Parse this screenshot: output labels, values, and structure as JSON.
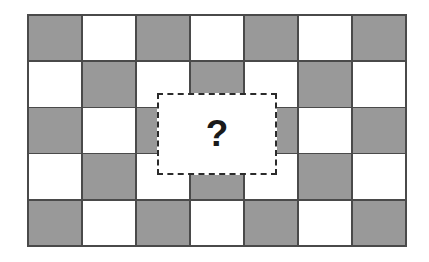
{
  "figure": {
    "background_color": "#ffffff"
  },
  "grid": {
    "name": "checkerboard",
    "columns": 7,
    "rows": 5,
    "cell_dark_color": "#999999",
    "cell_light_color": "#ffffff",
    "gridline_color": "#4a4a4a",
    "pattern": [
      [
        "dark",
        "light",
        "dark",
        "light",
        "dark",
        "light",
        "dark"
      ],
      [
        "light",
        "dark",
        "light",
        "dark",
        "light",
        "dark",
        "light"
      ],
      [
        "dark",
        "light",
        "dark",
        "light",
        "dark",
        "light",
        "dark"
      ],
      [
        "light",
        "dark",
        "light",
        "dark",
        "light",
        "dark",
        "light"
      ],
      [
        "dark",
        "light",
        "dark",
        "light",
        "dark",
        "light",
        "dark"
      ]
    ]
  },
  "occluder": {
    "name": "hidden-region",
    "label": "?",
    "border_style": "dashed",
    "border_color": "#2b2b2b",
    "fill_color": "#ffffff",
    "x": 157,
    "y": 93,
    "width": 120,
    "height": 82
  }
}
